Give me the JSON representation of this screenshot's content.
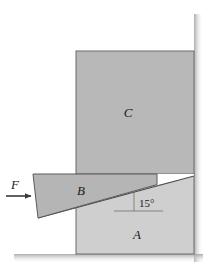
{
  "figure": {
    "canvas": {
      "width": 219,
      "height": 280,
      "background": "#ffffff"
    },
    "labels": {
      "block_a": "A",
      "block_b": "B",
      "block_c": "C",
      "force": "F",
      "angle": "15°"
    },
    "colors": {
      "block_a_fill": "#cfcfcf",
      "block_b_fill": "#b5b5b5",
      "block_c_fill": "#b8b8b8",
      "gap_fill": "#ffffff",
      "outline": "#555555",
      "line": "#3a3a3a",
      "text": "#1a1a1a",
      "shadow": "#bcbcbc"
    },
    "geometry": {
      "block_a": {
        "x": 76,
        "y": 174,
        "width": 118,
        "height": 74
      },
      "block_c": {
        "x": 76,
        "y": 51,
        "width": 118,
        "height": 123
      },
      "wedge_b_points": "33,174 157,174 157,184 38,218",
      "incline_line": "38,218 194,176",
      "angle_degrees": 15,
      "arrow": {
        "x1": 7,
        "y1": 196,
        "x2": 33,
        "y2": 196
      },
      "reference_line": {
        "x1": 115,
        "y1": 211,
        "x2": 162,
        "y2": 211
      }
    }
  }
}
